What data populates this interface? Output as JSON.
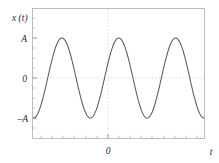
{
  "figure": {
    "background_color": "#ffffff",
    "frame_color": "#b9b9b9",
    "curve_color": "#555555",
    "gridline_color": "#d8d8c8",
    "text_color": "#2b2b2b"
  },
  "labels": {
    "y_axis_label": "x (t)",
    "x_axis_label": "t"
  },
  "y_ticks": [
    {
      "label": "A"
    },
    {
      "label": "0"
    },
    {
      "label": "–A"
    }
  ],
  "x_ticks": [
    {
      "label": "0"
    }
  ],
  "chart_data": {
    "type": "line",
    "title": "",
    "xlabel": "t",
    "ylabel": "x (t)",
    "series": [
      {
        "name": "x(t)",
        "formula": "A*cos(2*pi*t/T)",
        "amplitude_label": "A",
        "periods_shown": 3,
        "phase_at_t0": "maximum",
        "x": [
          -1.5,
          -1.4,
          -1.3,
          -1.2,
          -1.1,
          -1.0,
          -0.9,
          -0.8,
          -0.7,
          -0.6,
          -0.5,
          -0.4,
          -0.3,
          -0.2,
          -0.1,
          0.0,
          0.1,
          0.2,
          0.3,
          0.4,
          0.5,
          0.6,
          0.7,
          0.8,
          0.9,
          1.0,
          1.1,
          1.2,
          1.3,
          1.4,
          1.5
        ],
        "y": [
          -1.0,
          -0.809,
          -0.309,
          0.309,
          0.809,
          1.0,
          0.809,
          0.309,
          -0.309,
          -0.809,
          -1.0,
          -0.809,
          -0.309,
          0.309,
          0.809,
          1.0,
          0.809,
          0.309,
          -0.309,
          -0.809,
          -1.0,
          -0.809,
          -0.309,
          0.309,
          0.809,
          1.0,
          0.809,
          0.309,
          -0.309,
          -0.809,
          -1.0
        ]
      }
    ],
    "xlim": [
      -1.5,
      1.5
    ],
    "ylim": [
      -1.28,
      1.28
    ],
    "y_tick_values": [
      1,
      0,
      -1
    ],
    "y_tick_labels": [
      "A",
      "0",
      "–A"
    ],
    "x_tick_values": [
      0
    ],
    "x_tick_labels": [
      "0"
    ],
    "grid": "dotted at x=0 and y=0",
    "legend": "none"
  }
}
